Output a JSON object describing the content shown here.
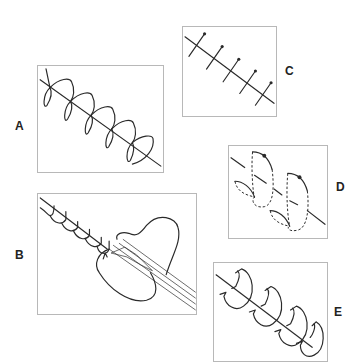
{
  "figure": {
    "panels": [
      {
        "id": "A",
        "label": "A",
        "description": "continuous looping suture along incision line"
      },
      {
        "id": "B",
        "label": "B",
        "description": "running suture with instrument and tissue pouch"
      },
      {
        "id": "C",
        "label": "C",
        "description": "simple interrupted sutures crossing incision"
      },
      {
        "id": "D",
        "label": "D",
        "description": "dashed-line buried mattress sutures"
      },
      {
        "id": "E",
        "label": "E",
        "description": "locking loop sutures along incision"
      }
    ]
  },
  "labels": {
    "a": "A",
    "b": "B",
    "c": "C",
    "d": "D",
    "e": "E"
  }
}
